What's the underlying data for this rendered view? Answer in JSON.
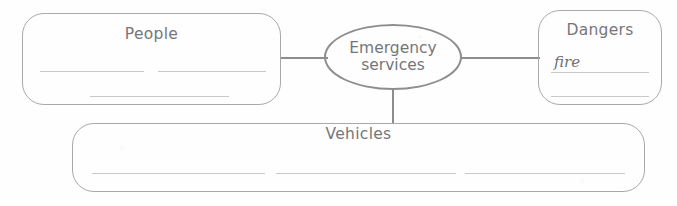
{
  "worksheet": {
    "type": "concept-map",
    "center": {
      "label": "Emergency\nservices"
    },
    "branches": [
      {
        "id": "people",
        "title": "People",
        "answers": [],
        "blank_lines": 3
      },
      {
        "id": "dangers",
        "title": "Dangers",
        "answers": [
          "fire"
        ],
        "blank_lines": 1
      },
      {
        "id": "vehicles",
        "title": "Vehicles",
        "answers": [],
        "blank_lines": 3
      }
    ],
    "colors": {
      "outline": "#a9a9ab",
      "ellipse_outline": "#8e8e90",
      "connector": "#8d8d8f",
      "text": "#76767a",
      "rule": "#c9c9cc",
      "background": "#fefefe"
    }
  }
}
